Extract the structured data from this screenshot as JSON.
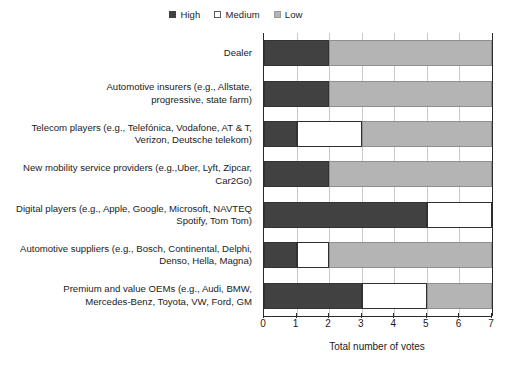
{
  "chart_data": {
    "type": "bar",
    "orientation": "horizontal",
    "stacked": true,
    "title": "",
    "xlabel": "Total number of votes",
    "ylabel": "",
    "xlim": [
      0,
      7
    ],
    "xticks": [
      "0",
      "1",
      "2",
      "3",
      "4",
      "5",
      "6",
      "7"
    ],
    "grid": true,
    "legend_position": "top-right",
    "categories": [
      "Dealer",
      "Automotive insurers (e.g., Allstate,\nprogressive, state farm)",
      "Telecom players (e.g., Telefónica, Vodafone, AT & T,\nVerizon, Deutsche telekom)",
      "New mobility service providers (e.g.,Uber, Lyft, Zipcar,\nCar2Go)",
      "Digital players (e.g., Apple, Google, Microsoft, NAVTEQ\nSpotify, Tom Tom)",
      "Automotive suppliers (e.g., Bosch, Continental, Delphi,\nDenso, Hella, Magna)",
      "Premium and value OEMs (e.g., Audi, BMW,\nMercedes-Benz, Toyota, VW, Ford, GM"
    ],
    "series": [
      {
        "name": "High",
        "color": "#414141",
        "values": [
          2,
          2,
          1,
          2,
          5,
          1,
          3
        ]
      },
      {
        "name": "Medium",
        "color": "#ffffff",
        "values": [
          0,
          0,
          2,
          0,
          2,
          1,
          2
        ]
      },
      {
        "name": "Low",
        "color": "#b4b4b4",
        "values": [
          5,
          5,
          4,
          5,
          0,
          5,
          2
        ]
      }
    ]
  },
  "legend": {
    "items": [
      {
        "label": "High",
        "swatch": "high-swatch-icon"
      },
      {
        "label": "Medium",
        "swatch": "medium-swatch-icon"
      },
      {
        "label": "Low",
        "swatch": "low-swatch-icon"
      }
    ]
  }
}
